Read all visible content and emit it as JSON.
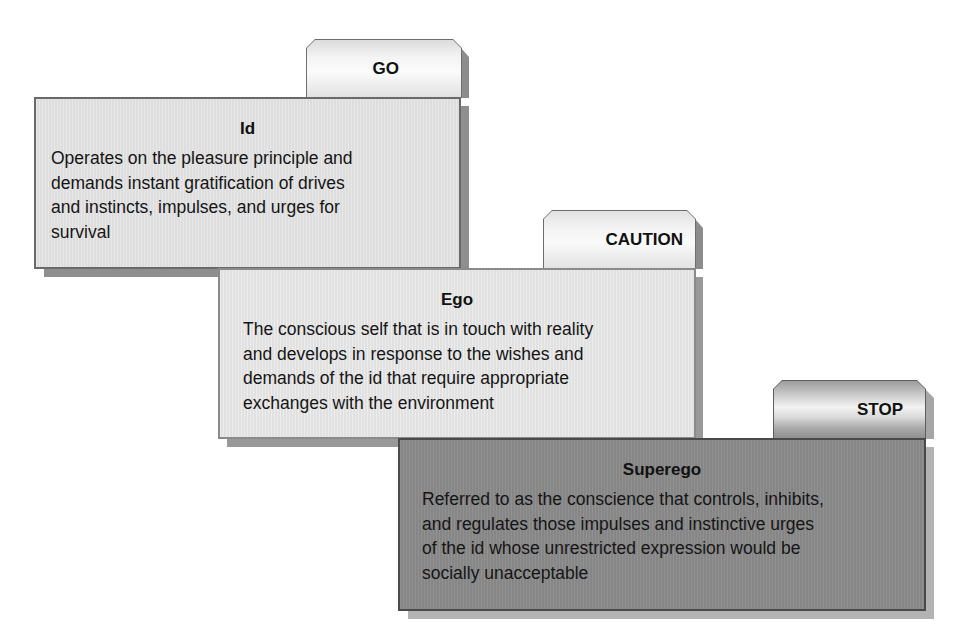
{
  "diagram": {
    "cards": [
      {
        "tab_label": "GO",
        "title": "Id",
        "body": "Operates on the pleasure principle and demands instant gratification of drives and instincts, impulses, and urges for survival",
        "lines": [
          "Operates on the pleasure principle and",
          "demands instant gratification of drives",
          "and instincts, impulses, and urges for",
          "survival"
        ],
        "box_color": "#e2e2e2",
        "tab_style": "light"
      },
      {
        "tab_label": "CAUTION",
        "title": "Ego",
        "body": "The conscious self that is in touch with reality and develops in response to the wishes and demands of the id that require appropriate exchanges with the environment",
        "lines": [
          "The conscious self that is in touch with reality",
          "and develops in response to the wishes and",
          "demands of the id that require appropriate",
          "exchanges with the environment"
        ],
        "box_color": "#e6e6e6",
        "tab_style": "light"
      },
      {
        "tab_label": "STOP",
        "title": "Superego",
        "body": "Referred to as the conscience that controls, inhibits, and regulates those impulses and instinctive urges of the id whose unrestricted expression would be socially unacceptable",
        "lines": [
          "Referred to as the conscience that controls, inhibits,",
          "and regulates those impulses and instinctive urges",
          "of the id whose unrestricted expression would be",
          "socially unacceptable"
        ],
        "box_color": "#8b8b8b",
        "tab_style": "metallic"
      }
    ]
  }
}
